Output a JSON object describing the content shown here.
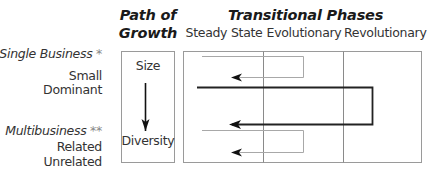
{
  "header": {
    "path_of_growth_line1": "Path of",
    "path_of_growth_line2": "Growth",
    "transitional_phases": "Transitional Phases"
  },
  "columns": [
    "Steady State",
    "Evolutionary",
    "Revolutionary"
  ],
  "row_groups": [
    {
      "title": "Single Business",
      "marker": "*",
      "items": [
        "Small",
        "Dominant"
      ]
    },
    {
      "title": "Multibusiness",
      "marker": "**",
      "items": [
        "Related",
        "Unrelated"
      ]
    }
  ],
  "path_box": {
    "top_label": "Size",
    "bottom_label": "Diversity"
  },
  "colors": {
    "box_border": "#9a9a9a",
    "thin_loop": "#a8a8a8",
    "thick_loop": "#222222",
    "arrow": "#111111"
  }
}
